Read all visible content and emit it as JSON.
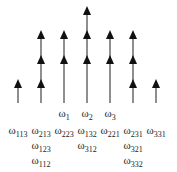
{
  "diagram": {
    "colors": {
      "stroke": "#444444",
      "arrowhead": "#111111",
      "text": "#222222"
    },
    "baseline_y": 103,
    "columns": [
      {
        "x": 18,
        "arrowheads_y": [
          86
        ],
        "top_y": 80
      },
      {
        "x": 41,
        "arrowheads_y": [
          37,
          62,
          86
        ],
        "top_y": 31
      },
      {
        "x": 64,
        "arrowheads_y": [
          37,
          62
        ],
        "top_y": 31
      },
      {
        "x": 87,
        "arrowheads_y": [
          13,
          37,
          62
        ],
        "top_y": 7
      },
      {
        "x": 110,
        "arrowheads_y": [
          37,
          62
        ],
        "top_y": 31
      },
      {
        "x": 133,
        "arrowheads_y": [
          37,
          62,
          86
        ],
        "top_y": 31
      },
      {
        "x": 156,
        "arrowheads_y": [
          86
        ],
        "top_y": 80
      }
    ],
    "top_labels": [
      {
        "x": 64,
        "y": 107,
        "sym": "ω",
        "sub": "1"
      },
      {
        "x": 87,
        "y": 107,
        "sym": "ω",
        "sub": "2"
      },
      {
        "x": 110,
        "y": 107,
        "sym": "ω",
        "sub": "3"
      }
    ],
    "labels": [
      {
        "x": 18,
        "y": 124,
        "sym": "ω",
        "sub": "113"
      },
      {
        "x": 41,
        "y": 124,
        "sym": "ω",
        "sub": "213"
      },
      {
        "x": 41,
        "y": 139,
        "sym": "ω",
        "sub": "123"
      },
      {
        "x": 41,
        "y": 154,
        "sym": "ω",
        "sub": "112"
      },
      {
        "x": 64,
        "y": 124,
        "sym": "ω",
        "sub": "223"
      },
      {
        "x": 87,
        "y": 124,
        "sym": "ω",
        "sub": "132"
      },
      {
        "x": 87,
        "y": 139,
        "sym": "ω",
        "sub": "312"
      },
      {
        "x": 110,
        "y": 124,
        "sym": "ω",
        "sub": "221"
      },
      {
        "x": 133,
        "y": 124,
        "sym": "ω",
        "sub": "231"
      },
      {
        "x": 133,
        "y": 139,
        "sym": "ω",
        "sub": "321"
      },
      {
        "x": 133,
        "y": 154,
        "sym": "ω",
        "sub": "332"
      },
      {
        "x": 156,
        "y": 124,
        "sym": "ω",
        "sub": "331"
      }
    ]
  }
}
